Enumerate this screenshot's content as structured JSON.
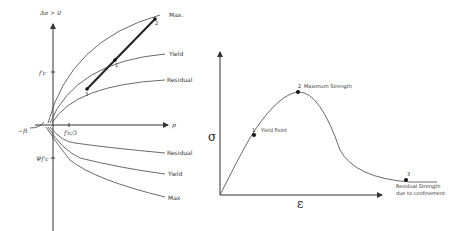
{
  "left_diagram": {
    "y_axis_label": "Δσ > 0",
    "x_axis_label": "p",
    "tick_fc": "f'c",
    "tick_neg_ft": "−ft",
    "tick_fc3": "f'c/3",
    "tick_psi": "Ψf'c",
    "upper_curves": [
      "Max.",
      "Yield",
      "Residual"
    ],
    "lower_curves": [
      "Residual",
      "Yield",
      "Max"
    ],
    "points": [
      "1",
      "2",
      "3"
    ]
  },
  "right_diagram": {
    "y_axis_label": "σ",
    "x_axis_label": "ε",
    "points": [
      {
        "num": "1",
        "label": "Yield Point"
      },
      {
        "num": "2",
        "label": "Maximum Strength"
      },
      {
        "num": "3",
        "label_line1": "Residual Strength",
        "label_line2": "due to confinement"
      }
    ]
  }
}
